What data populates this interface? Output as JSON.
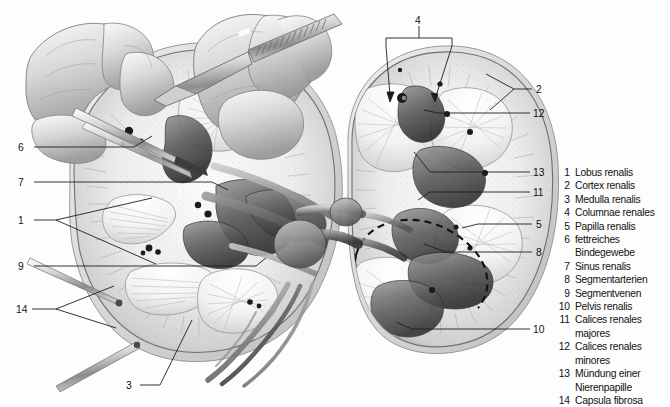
{
  "figure": {
    "background_color": "#fdfdfd",
    "ink_color": "#111111",
    "line_color": "#2b2b2b",
    "instruments": [
      {
        "name": "forceps",
        "position": "upper-left"
      },
      {
        "name": "scalpel",
        "position": "upper-right-of-left-kidney"
      },
      {
        "name": "probe-pin-upper",
        "position": "lower-left"
      },
      {
        "name": "probe-pin-lower",
        "position": "bottom-left"
      }
    ]
  },
  "legend": {
    "items": [
      {
        "num": "1",
        "label": "Lobus renalis"
      },
      {
        "num": "2",
        "label": "Cortex renalis"
      },
      {
        "num": "3",
        "label": "Medulla renalis"
      },
      {
        "num": "4",
        "label": "Columnae renales"
      },
      {
        "num": "5",
        "label": "Papilla renalis"
      },
      {
        "num": "6",
        "label": "fettreiches\nBindegewebe"
      },
      {
        "num": "7",
        "label": "Sinus renalis"
      },
      {
        "num": "8",
        "label": "Segmentarterien"
      },
      {
        "num": "9",
        "label": "Segmentvenen"
      },
      {
        "num": "10",
        "label": "Pelvis renalis"
      },
      {
        "num": "11",
        "label": "Calices renales majores"
      },
      {
        "num": "12",
        "label": "Calices renales minores"
      },
      {
        "num": "13",
        "label": "Mündung einer\nNierenpapille"
      },
      {
        "num": "14",
        "label": "Capsula fibrosa"
      }
    ]
  },
  "callouts": [
    {
      "id": "callout-4",
      "num": "4",
      "x": 415,
      "y": 15
    },
    {
      "id": "callout-2",
      "num": "2",
      "x": 536,
      "y": 84
    },
    {
      "id": "callout-12",
      "num": "12",
      "x": 533,
      "y": 108
    },
    {
      "id": "callout-6",
      "num": "6",
      "x": 18,
      "y": 142
    },
    {
      "id": "callout-13",
      "num": "13",
      "x": 533,
      "y": 167
    },
    {
      "id": "callout-7",
      "num": "7",
      "x": 18,
      "y": 177
    },
    {
      "id": "callout-11",
      "num": "11",
      "x": 533,
      "y": 187
    },
    {
      "id": "callout-1",
      "num": "1",
      "x": 18,
      "y": 215
    },
    {
      "id": "callout-5",
      "num": "5",
      "x": 536,
      "y": 219
    },
    {
      "id": "callout-8",
      "num": "8",
      "x": 536,
      "y": 247
    },
    {
      "id": "callout-9",
      "num": "9",
      "x": 18,
      "y": 261
    },
    {
      "id": "callout-14",
      "num": "14",
      "x": 16,
      "y": 304
    },
    {
      "id": "callout-10",
      "num": "10",
      "x": 533,
      "y": 324
    },
    {
      "id": "callout-3",
      "num": "3",
      "x": 126,
      "y": 380
    }
  ]
}
